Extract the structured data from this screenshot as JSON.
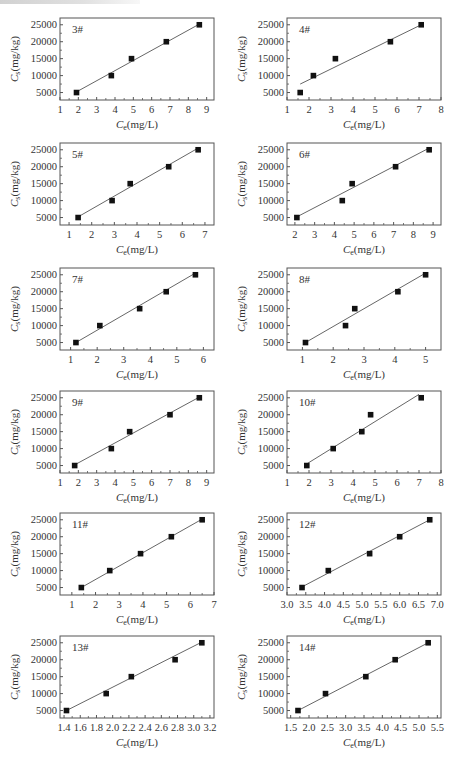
{
  "figure": {
    "x_axis_label": "Ce(mg/L)",
    "y_axis_label": "Cs(mg/kg)",
    "colors": {
      "marker": "#111111",
      "fit_line": "#555555",
      "frame": "#555555"
    }
  },
  "chart_data": [
    {
      "type": "scatter",
      "title": "3#",
      "xlabel": "Ce(mg/L)",
      "ylabel": "Cs(mg/kg)",
      "xlim": [
        1,
        9.4
      ],
      "ylim": [
        2800,
        27000
      ],
      "xticks": [
        1,
        2,
        3,
        4,
        5,
        6,
        7,
        8,
        9
      ],
      "yticks": [
        5000,
        10000,
        15000,
        20000,
        25000
      ],
      "x": [
        1.9,
        3.8,
        4.9,
        6.8,
        8.6
      ],
      "y": [
        5000,
        10000,
        15000,
        20000,
        25000
      ],
      "fit_line": {
        "x": [
          1.9,
          8.6
        ],
        "y": [
          5200,
          25200
        ]
      }
    },
    {
      "type": "scatter",
      "title": "4#",
      "xlabel": "Ce(mg/L)",
      "ylabel": "Cs(mg/kg)",
      "xlim": [
        1,
        8
      ],
      "ylim": [
        2800,
        27000
      ],
      "xticks": [
        1,
        2,
        3,
        4,
        5,
        6,
        7,
        8
      ],
      "yticks": [
        5000,
        10000,
        15000,
        20000,
        25000
      ],
      "x": [
        1.6,
        2.2,
        3.2,
        5.7,
        7.1
      ],
      "y": [
        5000,
        10000,
        15000,
        20000,
        25000
      ],
      "fit_line": {
        "x": [
          1.6,
          7.1
        ],
        "y": [
          7500,
          25000
        ]
      }
    },
    {
      "type": "scatter",
      "title": "5#",
      "xlabel": "Ce(mg/L)",
      "ylabel": "Cs(mg/kg)",
      "xlim": [
        0.6,
        7.4
      ],
      "ylim": [
        2800,
        27000
      ],
      "xticks": [
        1,
        2,
        3,
        4,
        5,
        6,
        7
      ],
      "yticks": [
        5000,
        10000,
        15000,
        20000,
        25000
      ],
      "x": [
        1.4,
        2.9,
        3.7,
        5.4,
        6.7
      ],
      "y": [
        5000,
        10000,
        15000,
        20000,
        25000
      ],
      "fit_line": {
        "x": [
          1.4,
          6.7
        ],
        "y": [
          5200,
          25500
        ]
      }
    },
    {
      "type": "scatter",
      "title": "6#",
      "xlabel": "Ce(mg/L)",
      "ylabel": "Cs(mg/kg)",
      "xlim": [
        1.6,
        9.4
      ],
      "ylim": [
        2800,
        27000
      ],
      "xticks": [
        2,
        3,
        4,
        5,
        6,
        7,
        8,
        9
      ],
      "yticks": [
        5000,
        10000,
        15000,
        20000,
        25000
      ],
      "x": [
        2.1,
        4.4,
        4.9,
        7.1,
        8.8
      ],
      "y": [
        5000,
        10000,
        15000,
        20000,
        25000
      ],
      "fit_line": {
        "x": [
          2.1,
          8.8
        ],
        "y": [
          5200,
          25500
        ]
      }
    },
    {
      "type": "scatter",
      "title": "7#",
      "xlabel": "Ce(mg/L)",
      "ylabel": "Cs(mg/kg)",
      "xlim": [
        0.6,
        6.4
      ],
      "ylim": [
        2800,
        27000
      ],
      "xticks": [
        1,
        2,
        3,
        4,
        5,
        6
      ],
      "yticks": [
        5000,
        10000,
        15000,
        20000,
        25000
      ],
      "x": [
        1.2,
        2.1,
        3.6,
        4.6,
        5.7
      ],
      "y": [
        5000,
        10000,
        15000,
        20000,
        25000
      ],
      "fit_line": {
        "x": [
          1.2,
          5.7
        ],
        "y": [
          5000,
          25500
        ]
      }
    },
    {
      "type": "scatter",
      "title": "8#",
      "xlabel": "Ce(mg/L)",
      "ylabel": "Cs(mg/kg)",
      "xlim": [
        0.5,
        5.5
      ],
      "ylim": [
        2800,
        27000
      ],
      "xticks": [
        1,
        2,
        3,
        4,
        5
      ],
      "yticks": [
        5000,
        10000,
        15000,
        20000,
        25000
      ],
      "x": [
        1.1,
        2.4,
        2.7,
        4.1,
        5.0
      ],
      "y": [
        5000,
        10000,
        15000,
        20000,
        25000
      ],
      "fit_line": {
        "x": [
          1.1,
          5.0
        ],
        "y": [
          5000,
          25500
        ]
      }
    },
    {
      "type": "scatter",
      "title": "9#",
      "xlabel": "Ce(mg/L)",
      "ylabel": "Cs(mg/kg)",
      "xlim": [
        1,
        9.4
      ],
      "ylim": [
        2800,
        27000
      ],
      "xticks": [
        1,
        2,
        3,
        4,
        5,
        6,
        7,
        8,
        9
      ],
      "yticks": [
        5000,
        10000,
        15000,
        20000,
        25000
      ],
      "x": [
        1.8,
        3.8,
        4.8,
        7.0,
        8.6
      ],
      "y": [
        5000,
        10000,
        15000,
        20000,
        25000
      ],
      "fit_line": {
        "x": [
          1.8,
          8.6
        ],
        "y": [
          5200,
          25200
        ]
      }
    },
    {
      "type": "scatter",
      "title": "10#",
      "xlabel": "Ce(mg/L)",
      "ylabel": "Cs(mg/kg)",
      "xlim": [
        1,
        8
      ],
      "ylim": [
        2800,
        27000
      ],
      "xticks": [
        1,
        2,
        3,
        4,
        5,
        6,
        7,
        8
      ],
      "yticks": [
        5000,
        10000,
        15000,
        20000,
        25000
      ],
      "x": [
        1.9,
        3.1,
        4.4,
        4.8,
        7.1
      ],
      "y": [
        5000,
        10000,
        15000,
        20000,
        25000
      ],
      "fit_line": {
        "x": [
          1.9,
          7.0
        ],
        "y": [
          5500,
          26000
        ]
      }
    },
    {
      "type": "scatter",
      "title": "11#",
      "xlabel": "Ce(mg/L)",
      "ylabel": "Cs(mg/kg)",
      "xlim": [
        0.5,
        7
      ],
      "ylim": [
        2800,
        27000
      ],
      "xticks": [
        1,
        2,
        3,
        4,
        5,
        6,
        7
      ],
      "yticks": [
        5000,
        10000,
        15000,
        20000,
        25000
      ],
      "x": [
        1.4,
        2.6,
        3.9,
        5.2,
        6.5
      ],
      "y": [
        5000,
        10000,
        15000,
        20000,
        25000
      ],
      "fit_line": {
        "x": [
          1.4,
          6.5
        ],
        "y": [
          5000,
          25200
        ]
      }
    },
    {
      "type": "scatter",
      "title": "12#",
      "xlabel": "Ce(mg/L)",
      "ylabel": "Cs(mg/kg)",
      "xlim": [
        3.0,
        7.1
      ],
      "ylim": [
        2800,
        27000
      ],
      "xticks": [
        3.0,
        3.5,
        4.0,
        4.5,
        5.0,
        5.5,
        6.0,
        6.5,
        7.0
      ],
      "yticks": [
        5000,
        10000,
        15000,
        20000,
        25000
      ],
      "x": [
        3.4,
        4.1,
        5.2,
        6.0,
        6.8
      ],
      "y": [
        5000,
        10000,
        15000,
        20000,
        25000
      ],
      "fit_line": {
        "x": [
          3.4,
          6.8
        ],
        "y": [
          5200,
          25000
        ]
      }
    },
    {
      "type": "scatter",
      "title": "13#",
      "xlabel": "Ce(mg/L)",
      "ylabel": "Cs(mg/kg)",
      "xlim": [
        1.35,
        3.25
      ],
      "ylim": [
        2800,
        27000
      ],
      "xticks": [
        1.4,
        1.6,
        1.8,
        2.0,
        2.2,
        2.4,
        2.6,
        2.8,
        3.0,
        3.2
      ],
      "yticks": [
        5000,
        10000,
        15000,
        20000,
        25000
      ],
      "x": [
        1.43,
        1.92,
        2.23,
        2.77,
        3.1
      ],
      "y": [
        5000,
        10000,
        15000,
        20000,
        25000
      ],
      "fit_line": {
        "x": [
          1.43,
          3.1
        ],
        "y": [
          5000,
          25200
        ]
      }
    },
    {
      "type": "scatter",
      "title": "14#",
      "xlabel": "Ce(mg/L)",
      "ylabel": "Cs(mg/kg)",
      "xlim": [
        1.4,
        5.6
      ],
      "ylim": [
        2800,
        27000
      ],
      "xticks": [
        1.5,
        2.0,
        2.5,
        3.0,
        3.5,
        4.0,
        4.5,
        5.0,
        5.5
      ],
      "yticks": [
        5000,
        10000,
        15000,
        20000,
        25000
      ],
      "x": [
        1.7,
        2.45,
        3.55,
        4.35,
        5.25
      ],
      "y": [
        5000,
        10000,
        15000,
        20000,
        25000
      ],
      "fit_line": {
        "x": [
          1.7,
          5.25
        ],
        "y": [
          5000,
          25000
        ]
      }
    }
  ],
  "layout": {
    "panels": [
      {
        "left": 0,
        "top": 12
      },
      {
        "left": 227,
        "top": 12
      },
      {
        "left": 0,
        "top": 137
      },
      {
        "left": 227,
        "top": 137
      },
      {
        "left": 0,
        "top": 262
      },
      {
        "left": 227,
        "top": 262
      },
      {
        "left": 0,
        "top": 385
      },
      {
        "left": 227,
        "top": 385
      },
      {
        "left": 0,
        "top": 507
      },
      {
        "left": 227,
        "top": 507
      },
      {
        "left": 0,
        "top": 630
      },
      {
        "left": 227,
        "top": 630
      }
    ]
  }
}
